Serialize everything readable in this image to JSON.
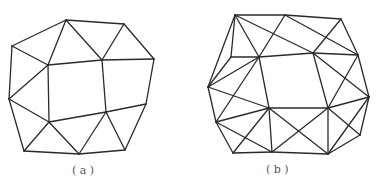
{
  "figures": [
    {
      "id": "a",
      "caption": "( a )",
      "vertices": {
        "P1": [
          66,
          20
        ],
        "P2": [
          124,
          24
        ],
        "P3": [
          12,
          46
        ],
        "P4": [
          154,
          59
        ],
        "P5": [
          48,
          65
        ],
        "P6": [
          102,
          60
        ],
        "P7": [
          106,
          112
        ],
        "P8": [
          49,
          122
        ],
        "P9": [
          9,
          99
        ],
        "P10": [
          146,
          104
        ],
        "P11": [
          24,
          151
        ],
        "P12": [
          79,
          154
        ],
        "P13": [
          125,
          150
        ]
      },
      "edges": [
        [
          "P1",
          "P2"
        ],
        [
          "P1",
          "P3"
        ],
        [
          "P1",
          "P5"
        ],
        [
          "P1",
          "P6"
        ],
        [
          "P2",
          "P6"
        ],
        [
          "P2",
          "P4"
        ],
        [
          "P3",
          "P5"
        ],
        [
          "P3",
          "P9"
        ],
        [
          "P5",
          "P6"
        ],
        [
          "P5",
          "P9"
        ],
        [
          "P5",
          "P8"
        ],
        [
          "P6",
          "P4"
        ],
        [
          "P6",
          "P7"
        ],
        [
          "P4",
          "P10"
        ],
        [
          "P7",
          "P10"
        ],
        [
          "P8",
          "P7"
        ],
        [
          "P8",
          "P9"
        ],
        [
          "P9",
          "P11"
        ],
        [
          "P8",
          "P11"
        ],
        [
          "P8",
          "P12"
        ],
        [
          "P7",
          "P12"
        ],
        [
          "P7",
          "P13"
        ],
        [
          "P10",
          "P13"
        ],
        [
          "P11",
          "P12"
        ],
        [
          "P12",
          "P13"
        ]
      ]
    },
    {
      "id": "b",
      "caption": "( b )",
      "vertices": {
        "A": [
          235,
          15
        ],
        "B": [
          285,
          15
        ],
        "C": [
          341,
          19
        ],
        "D": [
          231,
          57
        ],
        "E": [
          259,
          57
        ],
        "F": [
          313,
          53
        ],
        "G": [
          358,
          55
        ],
        "H": [
          208,
          87
        ],
        "I": [
          369,
          97
        ],
        "J": [
          269,
          108
        ],
        "K": [
          328,
          108
        ],
        "L": [
          216,
          122
        ],
        "M": [
          360,
          135
        ],
        "N": [
          233,
          153
        ],
        "O": [
          272,
          152
        ],
        "P": [
          328,
          154
        ]
      },
      "edges": [
        [
          "A",
          "B"
        ],
        [
          "B",
          "C"
        ],
        [
          "A",
          "D"
        ],
        [
          "A",
          "E"
        ],
        [
          "A",
          "F"
        ],
        [
          "B",
          "E"
        ],
        [
          "B",
          "G"
        ],
        [
          "C",
          "F"
        ],
        [
          "C",
          "G"
        ],
        [
          "D",
          "E"
        ],
        [
          "E",
          "F"
        ],
        [
          "F",
          "G"
        ],
        [
          "A",
          "H"
        ],
        [
          "D",
          "H"
        ],
        [
          "H",
          "E"
        ],
        [
          "H",
          "J"
        ],
        [
          "H",
          "L"
        ],
        [
          "E",
          "L"
        ],
        [
          "E",
          "J"
        ],
        [
          "L",
          "J"
        ],
        [
          "L",
          "N"
        ],
        [
          "L",
          "O"
        ],
        [
          "N",
          "J"
        ],
        [
          "N",
          "O"
        ],
        [
          "J",
          "O"
        ],
        [
          "F",
          "K"
        ],
        [
          "F",
          "I"
        ],
        [
          "G",
          "K"
        ],
        [
          "G",
          "I"
        ],
        [
          "K",
          "I"
        ],
        [
          "I",
          "M"
        ],
        [
          "K",
          "M"
        ],
        [
          "K",
          "P"
        ],
        [
          "M",
          "P"
        ],
        [
          "I",
          "P"
        ],
        [
          "J",
          "K"
        ],
        [
          "J",
          "P"
        ],
        [
          "K",
          "O"
        ],
        [
          "O",
          "P"
        ]
      ]
    }
  ]
}
